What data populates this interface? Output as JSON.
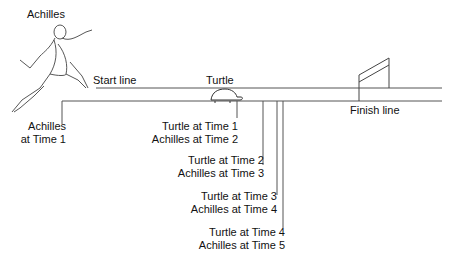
{
  "labels": {
    "achilles": "Achilles",
    "start_line": "Start line",
    "turtle": "Turtle",
    "finish_line": "Finish line",
    "achilles_time1_a": "Achilles",
    "achilles_time1_b": "at Time 1",
    "t1_a": "Turtle at Time 1",
    "t1_b": "Achilles at Time 2",
    "t2_a": "Turtle at Time 2",
    "t2_b": "Achilles at Time 3",
    "t3_a": "Turtle at Time 3",
    "t3_b": "Achilles at Time 4",
    "t4_a": "Turtle at Time 4",
    "t4_b": "Achilles at Time 5"
  },
  "colors": {
    "line": "#555555",
    "text": "#111111"
  }
}
